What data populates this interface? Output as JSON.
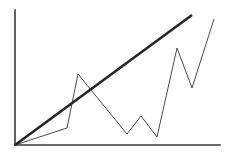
{
  "chart_data": {
    "type": "line",
    "title": "",
    "subtitle": "",
    "xlabel": "",
    "ylabel": "",
    "grid": false,
    "legend": "none",
    "background_color": "#ffffff",
    "axis": {
      "color": "#3a3a3a",
      "x_axis_width": 1.6,
      "y_axis_width": 1.6,
      "origin": [
        15,
        145
      ],
      "x_axis_end": [
        220,
        145
      ],
      "y_axis_top": [
        15,
        10
      ],
      "xlim": [
        0,
        100
      ],
      "ylim": [
        0,
        100
      ],
      "xticks": [],
      "yticks": [],
      "xticklabels": [],
      "yticklabels": []
    },
    "series": [
      {
        "name": "trend",
        "style": "thick-straight-line",
        "color": "#262626",
        "width": 2.6,
        "points_px": [
          [
            15,
            145
          ],
          [
            192,
            15
          ]
        ],
        "x": [
          0,
          86
        ],
        "values": [
          0,
          96
        ]
      },
      {
        "name": "volatile",
        "style": "thin-zigzag-line",
        "color": "#4a4a4a",
        "width": 1.0,
        "points_px": [
          [
            15,
            145
          ],
          [
            67,
            128
          ],
          [
            78,
            74
          ],
          [
            127,
            134
          ],
          [
            141,
            116
          ],
          [
            157,
            137
          ],
          [
            177,
            48
          ],
          [
            192,
            88
          ],
          [
            214,
            19
          ]
        ],
        "x": [
          0,
          25,
          31,
          55,
          61,
          69,
          79,
          86,
          97
        ],
        "values": [
          0,
          13,
          53,
          8,
          21,
          6,
          72,
          42,
          93
        ]
      }
    ]
  }
}
